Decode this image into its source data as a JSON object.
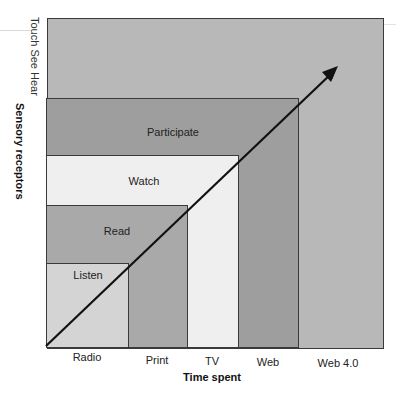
{
  "diagram": {
    "y_axis": {
      "title": "Sensory receptors",
      "scale_label": "Touch See Hear"
    },
    "x_axis": {
      "title": "Time spent",
      "ticks": [
        "Radio",
        "Print",
        "TV",
        "Web",
        "Web 4.0"
      ]
    },
    "levels": [
      {
        "name": "Listen",
        "media": "Radio",
        "color": "#d4d4d4"
      },
      {
        "name": "Read",
        "media": "Print",
        "color": "#a9a9a9"
      },
      {
        "name": "Watch",
        "media": "TV",
        "color": "#efefef"
      },
      {
        "name": "Participate",
        "media": "Web",
        "color": "#9e9e9e"
      },
      {
        "name": "",
        "media": "Web 4.0",
        "color": "#b8b8b8"
      }
    ],
    "arrow": {
      "direction": "up-right",
      "color": "#111111"
    }
  }
}
